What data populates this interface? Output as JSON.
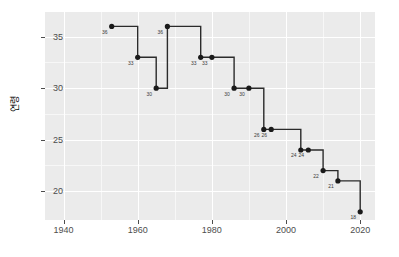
{
  "chart_data": {
    "type": "line",
    "subtype": "step",
    "title": "",
    "xlabel": "",
    "ylabel": "연령",
    "xlim": [
      1935,
      2024
    ],
    "ylim": [
      17.2,
      37.4
    ],
    "xticks": [
      1940,
      1960,
      1980,
      2000,
      2020
    ],
    "xtick_labels": [
      "1940",
      "1960",
      "1980",
      "2000",
      "2020"
    ],
    "yticks": [
      20,
      25,
      30,
      35
    ],
    "ytick_labels": [
      "20",
      "25",
      "30",
      "35"
    ],
    "x_minor_ticks": [
      1950,
      1970,
      1990,
      2010
    ],
    "y_minor_ticks": [
      22.5,
      27.5,
      32.5,
      37.5
    ],
    "grid": true,
    "legend": "none",
    "panel_background": "#ebebeb",
    "grid_major_color": "#ffffff",
    "grid_minor_color": "#f7f7f7",
    "line_color": "#2b2b2b",
    "point_color": "#1a1a1a",
    "axis_text_color": "#4d4d4d",
    "point_label_color": "#3a3a3a",
    "x": [
      1953,
      1960,
      1965,
      1968,
      1977,
      1980,
      1986,
      1990,
      1994,
      1996,
      2004,
      2006,
      2010,
      2014,
      2020
    ],
    "y": [
      36,
      33,
      30,
      36,
      33,
      33,
      30,
      30,
      26,
      26,
      24,
      24,
      22,
      21,
      18
    ],
    "point_labels": [
      "36",
      "33",
      "30",
      "36",
      "33",
      "33",
      "30",
      "30",
      "26",
      "26",
      "24",
      "24",
      "22",
      "21",
      "18"
    ],
    "points": [
      {
        "x": 1953,
        "y": 36,
        "label": "36"
      },
      {
        "x": 1960,
        "y": 33,
        "label": "33"
      },
      {
        "x": 1965,
        "y": 30,
        "label": "30"
      },
      {
        "x": 1968,
        "y": 36,
        "label": "36"
      },
      {
        "x": 1977,
        "y": 33,
        "label": "33"
      },
      {
        "x": 1980,
        "y": 33,
        "label": "33"
      },
      {
        "x": 1986,
        "y": 30,
        "label": "30"
      },
      {
        "x": 1990,
        "y": 30,
        "label": "30"
      },
      {
        "x": 1994,
        "y": 26,
        "label": "26"
      },
      {
        "x": 1996,
        "y": 26,
        "label": "26"
      },
      {
        "x": 2004,
        "y": 24,
        "label": "24"
      },
      {
        "x": 2006,
        "y": 24,
        "label": "24"
      },
      {
        "x": 2010,
        "y": 22,
        "label": "22"
      },
      {
        "x": 2014,
        "y": 21,
        "label": "21"
      },
      {
        "x": 2020,
        "y": 18,
        "label": "18"
      }
    ]
  }
}
